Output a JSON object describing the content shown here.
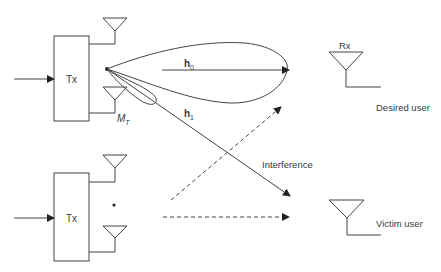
{
  "diagram": {
    "top_transmitter": {
      "label": "Tx",
      "antenna_label_main": "M",
      "antenna_label_sub": "T"
    },
    "bottom_transmitter": {
      "label": "Tx"
    },
    "channels": {
      "h0": {
        "main": "h",
        "sub": "0"
      },
      "h1": {
        "main": "h",
        "sub": "1"
      }
    },
    "receiver": {
      "label": "Rx"
    },
    "desired_user_label": "Desired user",
    "victim_user_label": "Victim user",
    "interference_label": "Interference",
    "colors": {
      "stroke": "#444444",
      "text": "#3a3a3a",
      "background": "#ffffff"
    }
  }
}
